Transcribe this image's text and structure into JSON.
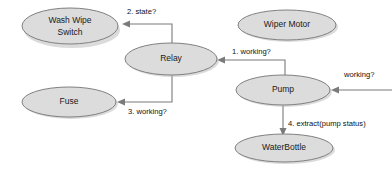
{
  "diagram": {
    "canvas": {
      "width": 392,
      "height": 170
    },
    "colors": {
      "node_fill": "#dcdcdc",
      "node_stroke": "#808080",
      "shadow": "#bdbdbd",
      "edge": "#7a7a7a",
      "text": "#111111",
      "background": "#ffffff"
    },
    "nodes": [
      {
        "id": "wash-wipe-switch",
        "label_line1": "Wash Wipe",
        "label_line2": "Switch",
        "cx": 70,
        "cy": 26,
        "rx": 48,
        "ry": 18
      },
      {
        "id": "relay",
        "label_line1": "Relay",
        "label_line2": "",
        "cx": 171,
        "cy": 59,
        "rx": 46,
        "ry": 16
      },
      {
        "id": "fuse",
        "label_line1": "Fuse",
        "label_line2": "",
        "cx": 69,
        "cy": 102,
        "rx": 47,
        "ry": 15
      },
      {
        "id": "wiper-motor",
        "label_line1": "Wiper Motor",
        "label_line2": "",
        "cx": 287,
        "cy": 25,
        "rx": 49,
        "ry": 15
      },
      {
        "id": "pump",
        "label_line1": "Pump",
        "label_line2": "",
        "cx": 283,
        "cy": 90,
        "rx": 47,
        "ry": 15
      },
      {
        "id": "water-bottle",
        "label_line1": "WaterBottle",
        "label_line2": "",
        "cx": 284,
        "cy": 148,
        "rx": 49,
        "ry": 14
      }
    ],
    "edges": [
      {
        "id": "relay-to-switch",
        "label": "2. state?",
        "from": "relay",
        "to": "wash-wipe-switch",
        "label_x": 127,
        "label_y": 14,
        "path": "M 172 46 L 172 24 L 124 24",
        "head": "122,24 130,20.5 130,27.5"
      },
      {
        "id": "pump-to-relay",
        "label": "1. working?",
        "from": "pump",
        "to": "relay",
        "label_x": 232,
        "label_y": 54,
        "path": "M 285 78 L 285 60 L 221 60",
        "head": "217,60 225,56.5 225,63.5"
      },
      {
        "id": "relay-to-fuse",
        "label": "3. working?",
        "from": "relay",
        "to": "fuse",
        "label_x": 128,
        "label_y": 114,
        "path": "M 172 74 L 172 102 L 121 102",
        "head": "117,102 125,98.5 125,105.5"
      },
      {
        "id": "external-to-pump",
        "label": "working?",
        "from": "external",
        "to": "pump",
        "label_x": 344,
        "label_y": 77,
        "path": "M 392 90 L 335 90",
        "head": "331,90 339,86.5 339,93.5"
      },
      {
        "id": "pump-to-waterbottle",
        "label": "4. extract(pump status)",
        "from": "pump",
        "to": "water-bottle",
        "label_x": 288,
        "label_y": 126,
        "path": "M 283 105 L 283 131",
        "head": "283,136 279.5,128 286.5,128"
      }
    ]
  }
}
